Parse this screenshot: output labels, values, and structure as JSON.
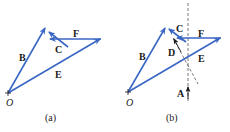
{
  "colors": {
    "vector": "#3a66c4",
    "ink": "#1a1a1a",
    "dash": "#555555"
  },
  "panels": [
    {
      "caption": "(a)",
      "origin_label": "O",
      "labels": {
        "B": "B",
        "C": "C",
        "E": "E",
        "F": "F"
      }
    },
    {
      "caption": "(b)",
      "origin_label": "O",
      "labels": {
        "A": "A",
        "B": "B",
        "C": "C",
        "D": "D",
        "E": "E",
        "F": "F"
      }
    }
  ]
}
